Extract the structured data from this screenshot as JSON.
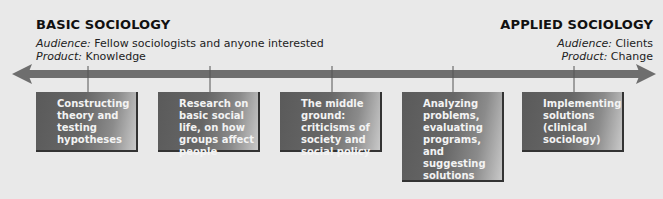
{
  "left_header": {
    "title": "BASIC SOCIOLOGY",
    "audience_label": "Audience:",
    "audience_value": " Fellow sociologists and anyone interested",
    "product_label": "Product:",
    "product_value": " Knowledge"
  },
  "right_header": {
    "title": "APPLIED SOCIOLOGY",
    "audience_label": "Audience:",
    "audience_value": " Clients",
    "product_label": "Product:",
    "product_value": " Change"
  },
  "colors": {
    "background": "#e9e9e9",
    "arrow": "#6e6e6e",
    "box_dark": "#5a5a5a",
    "box_light": "#c9c9c9",
    "box_text": "#f3f3f3"
  },
  "continuum": [
    {
      "label": "Constructing theory and testing hypotheses"
    },
    {
      "label": "Research on basic social life, on how groups affect people"
    },
    {
      "label": "The middle ground: criticisms of society and social policy"
    },
    {
      "label": "Analyzing problems, evaluating programs, and suggesting solutions"
    },
    {
      "label": "Implementing solutions (clinical sociology)"
    }
  ]
}
